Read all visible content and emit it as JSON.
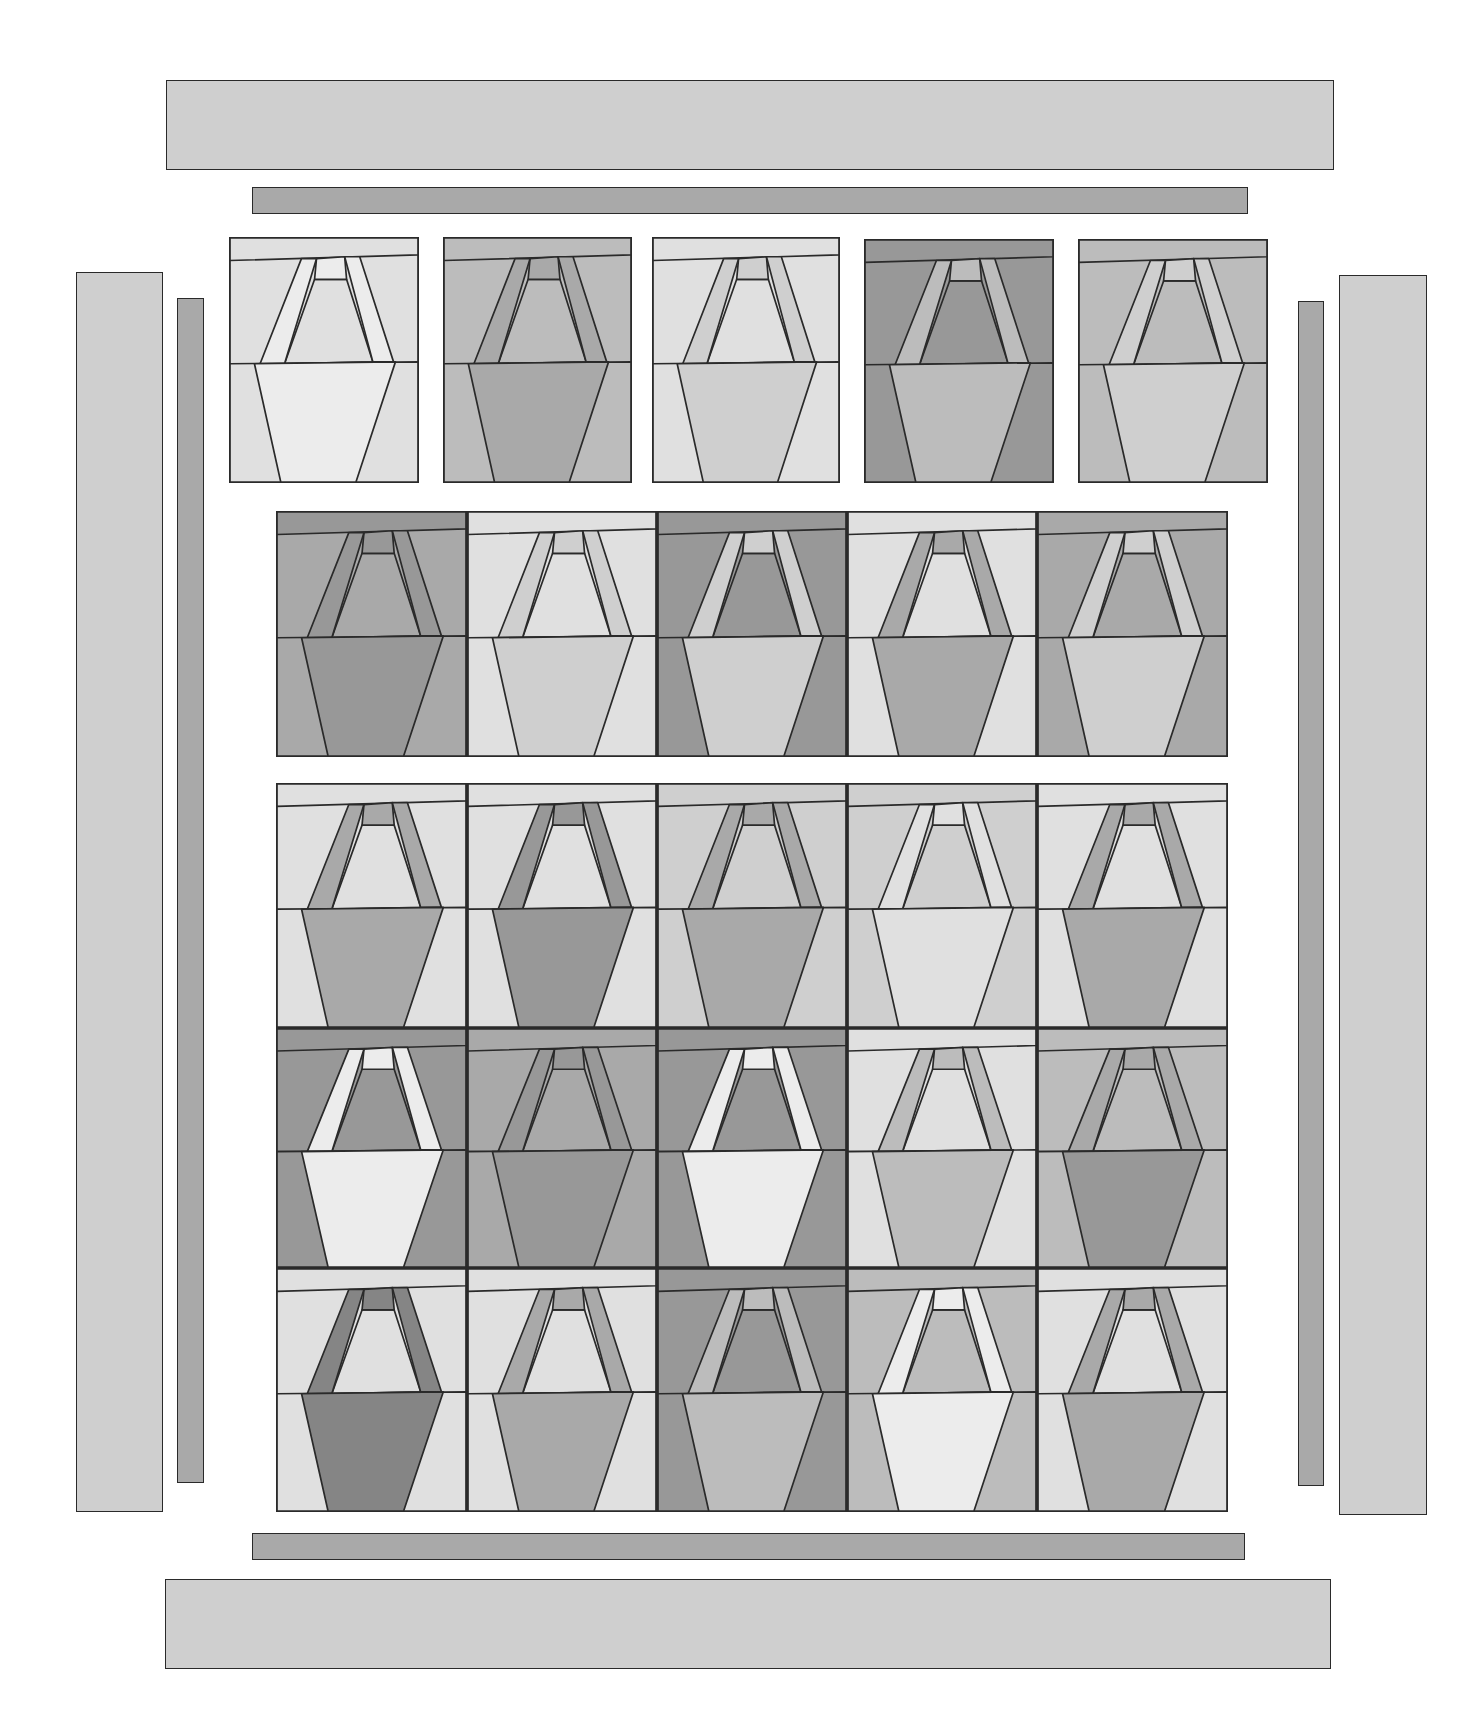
{
  "diagram": {
    "title": "",
    "type": "quilt-assembly-layout",
    "palette": {
      "L1": "#ececec",
      "L2": "#e0e0e0",
      "M1": "#cfcfcf",
      "M2": "#bcbcbc",
      "M3": "#a9a9a9",
      "D1": "#989898",
      "D2": "#858585",
      "outline": "#2a2a2a"
    },
    "borders": {
      "outer_top": {
        "x": 166,
        "y": 80,
        "w": 1168,
        "h": 90,
        "fill": "M1"
      },
      "inner_top": {
        "x": 252,
        "y": 187,
        "w": 996,
        "h": 27,
        "fill": "M3"
      },
      "outer_left": {
        "x": 76,
        "y": 272,
        "w": 87,
        "h": 1240,
        "fill": "M1"
      },
      "inner_left": {
        "x": 177,
        "y": 298,
        "w": 27,
        "h": 1185,
        "fill": "M3"
      },
      "inner_right": {
        "x": 1298,
        "y": 301,
        "w": 26,
        "h": 1185,
        "fill": "M3"
      },
      "outer_right": {
        "x": 1339,
        "y": 275,
        "w": 88,
        "h": 1240,
        "fill": "M1"
      },
      "inner_bottom": {
        "x": 252,
        "y": 1533,
        "w": 993,
        "h": 27,
        "fill": "M3"
      },
      "outer_bottom": {
        "x": 165,
        "y": 1579,
        "w": 1166,
        "h": 90,
        "fill": "M1"
      }
    },
    "rows": [
      {
        "name": "row-1-separated",
        "blocks": [
          {
            "x": 229,
            "y": 237,
            "w": 190,
            "h": 246,
            "top": "L2",
            "bg": "L2",
            "handle": "L1",
            "inner": "L2",
            "bowl": "L1",
            "bowlbg": "L2"
          },
          {
            "x": 443,
            "y": 237,
            "w": 189,
            "h": 246,
            "top": "M2",
            "bg": "M2",
            "handle": "M3",
            "inner": "M2",
            "bowl": "M3",
            "bowlbg": "M2"
          },
          {
            "x": 652,
            "y": 237,
            "w": 188,
            "h": 246,
            "top": "L2",
            "bg": "L2",
            "handle": "M1",
            "inner": "L2",
            "bowl": "M1",
            "bowlbg": "L2"
          },
          {
            "x": 864,
            "y": 239,
            "w": 190,
            "h": 244,
            "top": "D1",
            "bg": "D1",
            "handle": "M2",
            "inner": "D1",
            "bowl": "M2",
            "bowlbg": "D1"
          },
          {
            "x": 1078,
            "y": 239,
            "w": 190,
            "h": 244,
            "top": "M2",
            "bg": "M2",
            "handle": "M1",
            "inner": "M2",
            "bowl": "M1",
            "bowlbg": "M2"
          }
        ]
      },
      {
        "name": "row-2-joined",
        "blocks": [
          {
            "x": 276,
            "y": 511,
            "w": 191,
            "h": 246,
            "top": "D1",
            "bg": "M3",
            "handle": "D1",
            "inner": "M3",
            "bowl": "D1",
            "bowlbg": "M3"
          },
          {
            "x": 467,
            "y": 511,
            "w": 190,
            "h": 246,
            "top": "L2",
            "bg": "L2",
            "handle": "M1",
            "inner": "L2",
            "bowl": "M1",
            "bowlbg": "L2"
          },
          {
            "x": 657,
            "y": 511,
            "w": 190,
            "h": 246,
            "top": "D1",
            "bg": "D1",
            "handle": "M1",
            "inner": "D1",
            "bowl": "M1",
            "bowlbg": "D1"
          },
          {
            "x": 847,
            "y": 511,
            "w": 190,
            "h": 246,
            "top": "L2",
            "bg": "L2",
            "handle": "M3",
            "inner": "L2",
            "bowl": "M3",
            "bowlbg": "L2"
          },
          {
            "x": 1037,
            "y": 511,
            "w": 191,
            "h": 246,
            "top": "M3",
            "bg": "M3",
            "handle": "M1",
            "inner": "M3",
            "bowl": "M1",
            "bowlbg": "M3"
          }
        ]
      },
      {
        "name": "row-3-main",
        "blocks": [
          {
            "x": 276,
            "y": 783,
            "w": 191,
            "h": 245,
            "top": "L2",
            "bg": "L2",
            "handle": "M3",
            "inner": "L2",
            "bowl": "M3",
            "bowlbg": "L2"
          },
          {
            "x": 467,
            "y": 783,
            "w": 190,
            "h": 245,
            "top": "L2",
            "bg": "L2",
            "handle": "D1",
            "inner": "L2",
            "bowl": "D1",
            "bowlbg": "L2"
          },
          {
            "x": 657,
            "y": 783,
            "w": 190,
            "h": 245,
            "top": "M1",
            "bg": "M1",
            "handle": "M3",
            "inner": "M1",
            "bowl": "M3",
            "bowlbg": "M1"
          },
          {
            "x": 847,
            "y": 783,
            "w": 190,
            "h": 245,
            "top": "M1",
            "bg": "M1",
            "handle": "L2",
            "inner": "M1",
            "bowl": "L2",
            "bowlbg": "M1"
          },
          {
            "x": 1037,
            "y": 783,
            "w": 191,
            "h": 245,
            "top": "L2",
            "bg": "L2",
            "handle": "M3",
            "inner": "L2",
            "bowl": "M3",
            "bowlbg": "L2"
          }
        ]
      },
      {
        "name": "row-4-main",
        "blocks": [
          {
            "x": 276,
            "y": 1028,
            "w": 191,
            "h": 240,
            "top": "D1",
            "bg": "D1",
            "handle": "L1",
            "inner": "D1",
            "bowl": "L1",
            "bowlbg": "D1"
          },
          {
            "x": 467,
            "y": 1028,
            "w": 190,
            "h": 240,
            "top": "M3",
            "bg": "M3",
            "handle": "D1",
            "inner": "M3",
            "bowl": "D1",
            "bowlbg": "M3"
          },
          {
            "x": 657,
            "y": 1028,
            "w": 190,
            "h": 240,
            "top": "D1",
            "bg": "D1",
            "handle": "L1",
            "inner": "D1",
            "bowl": "L1",
            "bowlbg": "D1"
          },
          {
            "x": 847,
            "y": 1028,
            "w": 190,
            "h": 240,
            "top": "L2",
            "bg": "L2",
            "handle": "M2",
            "inner": "L2",
            "bowl": "M2",
            "bowlbg": "L2"
          },
          {
            "x": 1037,
            "y": 1028,
            "w": 191,
            "h": 240,
            "top": "M2",
            "bg": "M2",
            "handle": "M3",
            "inner": "M2",
            "bowl": "D1",
            "bowlbg": "M2"
          }
        ]
      },
      {
        "name": "row-5-main",
        "blocks": [
          {
            "x": 276,
            "y": 1268,
            "w": 191,
            "h": 244,
            "top": "L2",
            "bg": "L2",
            "handle": "D2",
            "inner": "L2",
            "bowl": "D2",
            "bowlbg": "L2"
          },
          {
            "x": 467,
            "y": 1268,
            "w": 190,
            "h": 244,
            "top": "L2",
            "bg": "L2",
            "handle": "M3",
            "inner": "L2",
            "bowl": "M3",
            "bowlbg": "L2"
          },
          {
            "x": 657,
            "y": 1268,
            "w": 190,
            "h": 244,
            "top": "D1",
            "bg": "D1",
            "handle": "M2",
            "inner": "D1",
            "bowl": "M2",
            "bowlbg": "D1"
          },
          {
            "x": 847,
            "y": 1268,
            "w": 190,
            "h": 244,
            "top": "M2",
            "bg": "M2",
            "handle": "L1",
            "inner": "M2",
            "bowl": "L1",
            "bowlbg": "M2"
          },
          {
            "x": 1037,
            "y": 1268,
            "w": 191,
            "h": 244,
            "top": "L2",
            "bg": "L2",
            "handle": "M3",
            "inner": "L2",
            "bowl": "M3",
            "bowlbg": "L2"
          }
        ]
      }
    ]
  }
}
